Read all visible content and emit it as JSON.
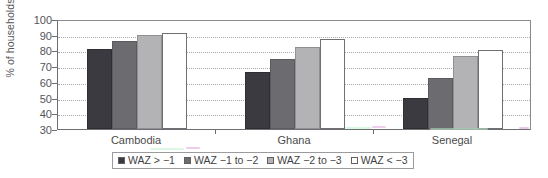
{
  "chart_data": {
    "type": "bar",
    "title": "",
    "xlabel": "",
    "ylabel": "% of households",
    "categories": [
      "Cambodia",
      "Ghana",
      "Senegal"
    ],
    "series": [
      {
        "name": "WAZ > −1",
        "color": "#3a3a40",
        "values": [
          81,
          66,
          50
        ]
      },
      {
        "name": "WAZ −1 to −2",
        "color": "#6b6b70",
        "values": [
          86,
          74.5,
          62.5
        ]
      },
      {
        "name": "WAZ −2 to −3",
        "color": "#b3b3b6",
        "values": [
          90,
          82,
          76.5
        ]
      },
      {
        "name": "WAZ < −3",
        "color": "#ffffff",
        "values": [
          91,
          87,
          80
        ]
      }
    ],
    "ylim": [
      30,
      100
    ],
    "yticks": [
      30,
      40,
      50,
      60,
      70,
      80,
      90,
      100
    ],
    "ytick_labels": [
      "30",
      "40",
      "50",
      "60",
      "70",
      "80",
      "90",
      "100"
    ],
    "grid": true,
    "grid_axis": "y",
    "grid_style": "dotted",
    "legend_position": "bottom",
    "legend_border": true
  },
  "axes": {
    "y_title": "% of households"
  },
  "legend": {
    "items": [
      {
        "label": "WAZ > −1"
      },
      {
        "label": "WAZ −1 to −2"
      },
      {
        "label": "WAZ −2 to −3"
      },
      {
        "label": "WAZ < −3"
      }
    ]
  }
}
